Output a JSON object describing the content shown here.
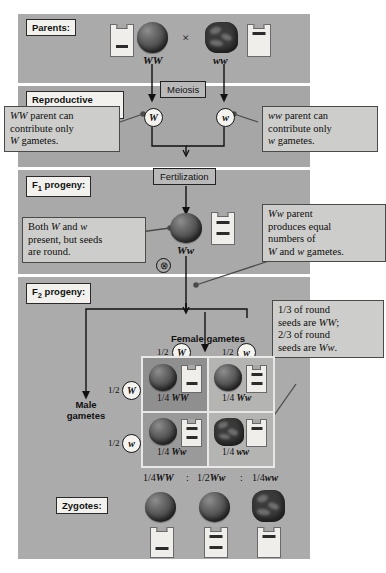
{
  "figure": {
    "bands": [
      {
        "id": "parents",
        "label": "Parents:"
      },
      {
        "id": "reproductive",
        "label": "Reproductive\ncells (gametes):"
      },
      {
        "id": "f1",
        "label": "F1 progeny:"
      },
      {
        "id": "f2",
        "label": "F2 progeny:"
      }
    ]
  },
  "labels": {
    "parents": "Parents:",
    "reproductive_line1": "Reproductive",
    "reproductive_line2": "cells (gametes):",
    "f1_progeny_pre": "F",
    "f1_progeny_sub": "1",
    "f1_progeny_post": " progeny:",
    "f2_progeny_pre": "F",
    "f2_progeny_sub": "2",
    "f2_progeny_post": " progeny:",
    "zygotes": "Zygotes:",
    "meiosis": "Meiosis",
    "fertilization": "Fertilization",
    "female_gametes": "Female gametes",
    "male_gametes_line1": "Male",
    "male_gametes_line2": "gametes",
    "cross_symbol": "×",
    "self_cross_symbol": "⊗"
  },
  "parents": {
    "left_genotype": "WW",
    "right_genotype": "ww",
    "left_phenotype": "round",
    "right_phenotype": "wrinkled"
  },
  "gametes": {
    "left_allele": "W",
    "right_allele": "w"
  },
  "f1": {
    "genotype": "Ww",
    "phenotype": "round"
  },
  "punnett": {
    "female_headers": [
      {
        "fraction": "1/2",
        "allele": "W"
      },
      {
        "fraction": "1/2",
        "allele": "w"
      }
    ],
    "male_headers": [
      {
        "fraction": "1/2",
        "allele": "W"
      },
      {
        "fraction": "1/2",
        "allele": "w"
      }
    ],
    "cells": [
      {
        "fraction": "1/4",
        "genotype": "WW",
        "phenotype": "round"
      },
      {
        "fraction": "1/4",
        "genotype": "Ww",
        "phenotype": "round"
      },
      {
        "fraction": "1/4",
        "genotype": "Ww",
        "phenotype": "round"
      },
      {
        "fraction": "1/4",
        "genotype": "ww",
        "phenotype": "wrinkled"
      }
    ]
  },
  "zygote_ratio": [
    {
      "fraction": "1/4",
      "genotype": "WW"
    },
    {
      "separator": ":"
    },
    {
      "fraction": "1/2",
      "genotype": "Ww"
    },
    {
      "separator": ":"
    },
    {
      "fraction": "1/4",
      "genotype": "ww"
    }
  ],
  "zygotes": [
    {
      "genotype": "WW",
      "phenotype": "round"
    },
    {
      "genotype": "Ww",
      "phenotype": "round"
    },
    {
      "genotype": "ww",
      "phenotype": "wrinkled"
    }
  ],
  "callouts": {
    "left_top": {
      "line1_italic": "WW",
      "line1_rest": " parent can",
      "line2": "contribute only",
      "line3_italic": "W",
      "line3_rest": " gametes."
    },
    "right_top": {
      "line1_italic": "ww",
      "line1_rest": " parent can",
      "line2": "contribute only",
      "line3_italic": "w",
      "line3_rest": " gametes."
    },
    "left_f1": {
      "line1a": "Both ",
      "line1_italic1": "W",
      "line1b": " and ",
      "line1_italic2": "w",
      "line2": "present, but seeds",
      "line3": "are round."
    },
    "right_f1": {
      "line1_italic": "Ww",
      "line1_rest": " parent",
      "line2": "produces equal",
      "line3": "numbers of",
      "line4_italic1": "W",
      "line4_mid": " and ",
      "line4_italic2": "w",
      "line4_rest": " gametes."
    },
    "right_f2": {
      "line1_frac": "1/3",
      "line1_rest": " of round",
      "line2a": "seeds are ",
      "line2_italic": "WW",
      "line2b": ";",
      "line3_frac": "2/3",
      "line3_rest": " of round",
      "line4a": "seeds are ",
      "line4_italic": "Ww",
      "line4b": "."
    }
  },
  "colors": {
    "panel": "#a8a8a8",
    "plate_fill": "#f2f1ee",
    "callout_fill": "#cdcdcb",
    "seed_dark": "#3a3a3a",
    "packet_fill": "#efeeea",
    "punnett_highlight": "#8f8f8f"
  }
}
